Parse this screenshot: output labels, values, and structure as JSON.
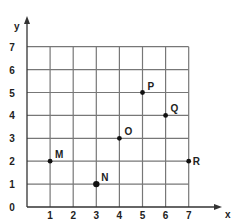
{
  "chart_data": {
    "type": "scatter",
    "title": "",
    "xlabel": "x",
    "ylabel": "y",
    "xlim": [
      0,
      7
    ],
    "ylim": [
      0,
      7
    ],
    "grid": true,
    "x_ticks": [
      "0",
      "1",
      "2",
      "3",
      "4",
      "5",
      "6",
      "7"
    ],
    "y_ticks": [
      "0",
      "1",
      "2",
      "3",
      "4",
      "5",
      "6",
      "7"
    ],
    "points": [
      {
        "label": "M",
        "x": 1,
        "y": 2
      },
      {
        "label": "N",
        "x": 3,
        "y": 1
      },
      {
        "label": "O",
        "x": 4,
        "y": 3
      },
      {
        "label": "P",
        "x": 5,
        "y": 5
      },
      {
        "label": "Q",
        "x": 6,
        "y": 4
      },
      {
        "label": "R",
        "x": 7,
        "y": 2
      }
    ],
    "colors": {
      "grid": "#777777",
      "axis": "#333333",
      "point": "#111111"
    }
  }
}
